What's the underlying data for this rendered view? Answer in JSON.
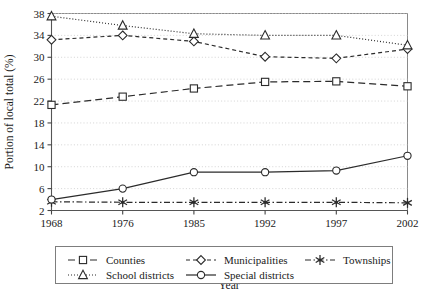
{
  "chart_data": {
    "type": "line",
    "title": "",
    "xlabel": "Year",
    "ylabel": "Portion of local total (%)",
    "categories": [
      "1968",
      "1976",
      "1985",
      "1992",
      "1997",
      "2002"
    ],
    "ylim": [
      2,
      38
    ],
    "yticks": [
      2,
      6,
      10,
      14,
      18,
      22,
      26,
      30,
      34,
      38
    ],
    "grid": true,
    "legend_position": "bottom",
    "series": [
      {
        "name": "Counties",
        "values": [
          21.3,
          22.8,
          24.3,
          25.5,
          25.6,
          24.7
        ],
        "marker": "square",
        "line_style": "dashed",
        "color": "#2b2b2b"
      },
      {
        "name": "Municipalities",
        "values": [
          33.2,
          34.0,
          32.9,
          30.1,
          29.8,
          31.5
        ],
        "marker": "diamond",
        "line_style": "dashed-short",
        "color": "#2b2b2b"
      },
      {
        "name": "Townships",
        "values": [
          3.6,
          3.5,
          3.5,
          3.5,
          3.5,
          3.4
        ],
        "marker": "star",
        "line_style": "dash-dot",
        "color": "#2b2b2b"
      },
      {
        "name": "School districts",
        "values": [
          37.5,
          35.8,
          34.3,
          34.0,
          34.0,
          32.2
        ],
        "marker": "triangle",
        "line_style": "dotted",
        "color": "#2b2b2b"
      },
      {
        "name": "Special districts",
        "values": [
          4.0,
          6.0,
          9.0,
          9.0,
          9.3,
          12.0
        ],
        "marker": "circle",
        "line_style": "solid",
        "color": "#2b2b2b"
      }
    ]
  },
  "legend": {
    "entries": [
      {
        "label": "Counties"
      },
      {
        "label": "Municipalities"
      },
      {
        "label": "Townships"
      },
      {
        "label": "School districts"
      },
      {
        "label": "Special districts"
      }
    ]
  },
  "axes": {
    "y_title": "Portion of local total (%)",
    "x_title": "Year",
    "y_tick_labels": [
      "38",
      "34",
      "30",
      "26",
      "22",
      "18",
      "14",
      "10",
      "6",
      "2"
    ],
    "x_tick_labels": [
      "1968",
      "1976",
      "1985",
      "1992",
      "1997",
      "2002"
    ]
  }
}
